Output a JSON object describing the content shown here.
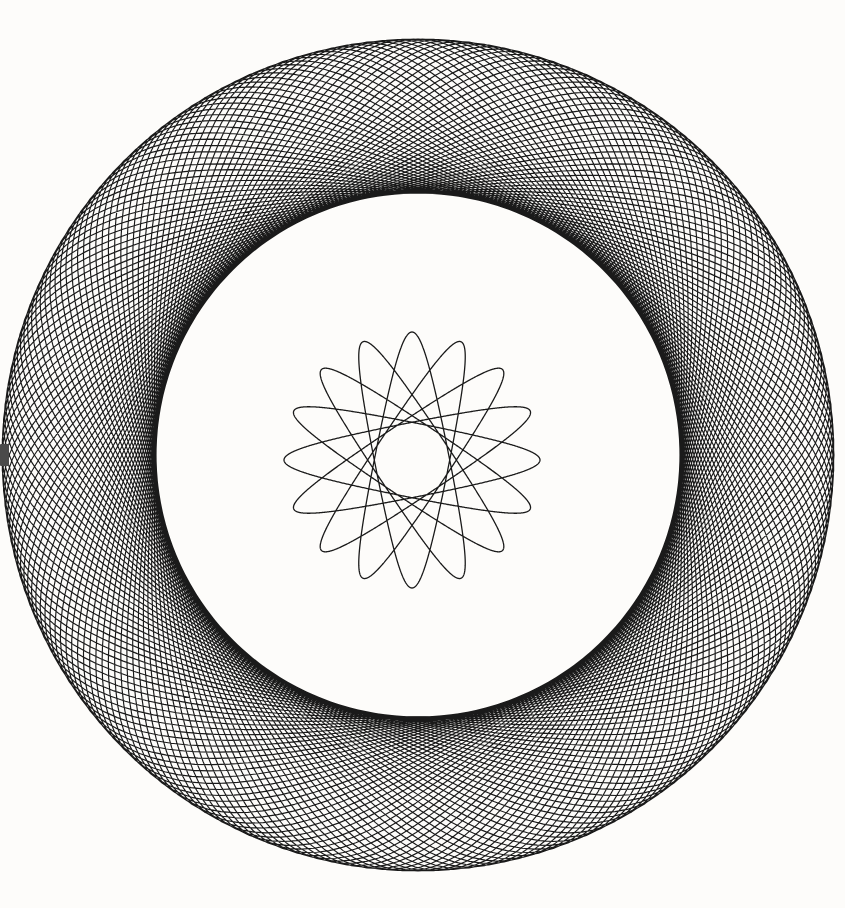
{
  "canvas": {
    "width": 845,
    "height": 908,
    "background_color": "#fdfcfa",
    "ink_color": "#1a1a1a"
  },
  "artwork": {
    "title": "Spirograph Hypotrochoid Drawing",
    "medium": "ink on paper",
    "description": "Two concentric spirograph rosettes: a large sparse outer ring and a small dense inner rosette"
  },
  "chart_data": {
    "type": "line",
    "xlabel": "",
    "ylabel": "",
    "grid": false,
    "legend": "none",
    "xlim": [
      0,
      845
    ],
    "ylim": [
      0,
      908
    ],
    "curves": [
      {
        "name": "outer-rosette",
        "kind": "hypotrochoid",
        "center_x": 418,
        "center_y": 455,
        "R": 416,
        "r": 154,
        "d": 148,
        "outer_radius": 416,
        "inner_radius": 262,
        "lobes": 77,
        "stroke_color": "#1a1a1a",
        "stroke_width": 1.15,
        "turns": 77,
        "samples": 9000
      },
      {
        "name": "inner-rosette",
        "kind": "hypotrochoid",
        "center_x": 412,
        "center_y": 460,
        "R": 128,
        "r": 56,
        "d": 52,
        "outer_radius": 128,
        "inner_radius": 37,
        "lobes": 23,
        "stroke_color": "#1a1a1a",
        "stroke_width": 1.3,
        "turns": 23,
        "samples": 6000
      }
    ],
    "annotations": [
      {
        "name": "left-edge-smudge",
        "x": 0,
        "y": 444,
        "width": 9,
        "height": 22,
        "color": "#4a4a4a"
      }
    ]
  }
}
